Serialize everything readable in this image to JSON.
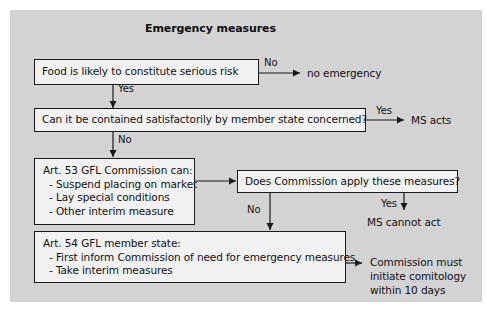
{
  "figure": {
    "title": "Emergency measures",
    "panel_color": "#d3d3d3",
    "box_fill": "#f2f2f2",
    "line_color": "#1a1a1a"
  },
  "boxes": {
    "risk_question": {
      "text": "Food is  likely to constitute serious risk"
    },
    "containment_question": {
      "text": "Can it be contained satisfactorily by member state concerned?"
    },
    "art53": {
      "heading": "Art. 53 GFL Commission can:",
      "items": [
        "- Suspend placing on market",
        "- Lay special conditions",
        "- Other interim measure"
      ]
    },
    "commission_question": {
      "text": "Does Commission apply these measures?"
    },
    "art54": {
      "heading": "Art. 54 GFL member state:",
      "items": [
        "- First inform Commission of need for emergency measures",
        "- Take interim measures"
      ]
    }
  },
  "edge_labels": {
    "risk_no": "No",
    "risk_yes": "Yes",
    "containment_yes": "Yes",
    "containment_no": "No",
    "commission_no": "No",
    "commission_yes": "Yes"
  },
  "terminals": {
    "no_emergency": "no emergency",
    "ms_acts": "MS acts",
    "ms_cannot_act": "MS cannot act",
    "comitology": {
      "line1": "Commission must",
      "line2": "initiate comitology",
      "line3": "within 10 days"
    }
  }
}
